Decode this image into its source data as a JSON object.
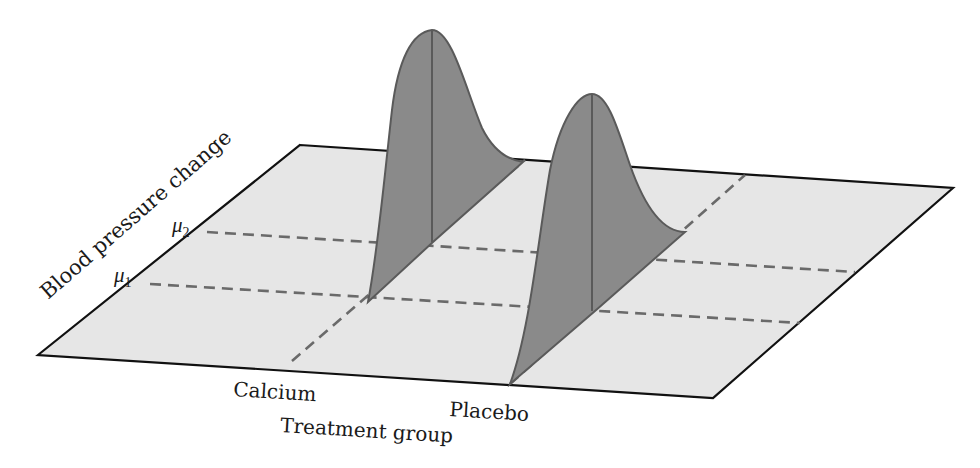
{
  "diagram": {
    "type": "3d-distribution-plane",
    "axes": {
      "y_label": "Blood pressure change",
      "x_label": "Treatment group"
    },
    "groups": [
      {
        "label": "Calcium",
        "mean_symbol": "μ",
        "mean_subscript": "1"
      },
      {
        "label": "Placebo",
        "mean_symbol": "μ",
        "mean_subscript": "2"
      }
    ],
    "levels": [
      {
        "symbol": "μ",
        "subscript": "2"
      },
      {
        "symbol": "μ",
        "subscript": "1"
      }
    ],
    "colors": {
      "plane_fill": "#e6e6e6",
      "plane_edge": "#111111",
      "curve_fill": "#8a8a8a",
      "curve_edge": "#5a5a5a",
      "dashed_line": "#6a6a6a"
    }
  }
}
